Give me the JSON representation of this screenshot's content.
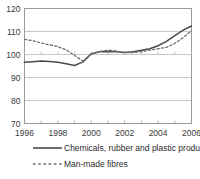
{
  "chart_data": {
    "type": "line",
    "title": "",
    "xlabel": "",
    "ylabel": "",
    "xlim": [
      1996,
      2006
    ],
    "ylim": [
      70,
      120
    ],
    "yticks": [
      70,
      80,
      90,
      100,
      110,
      120
    ],
    "xticks": [
      1996,
      1998,
      2000,
      2002,
      2004,
      2006
    ],
    "xtick_labels": [
      "1996",
      "1998",
      "2000",
      "2002",
      "2004",
      "2006"
    ],
    "ytick_labels": [
      "70",
      "80",
      "90",
      "100",
      "110",
      "120"
    ],
    "grid": true,
    "grid_axis": "y",
    "legend_position": "bottom",
    "x": [
      1996,
      1996.5,
      1997,
      1997.5,
      1998,
      1998.5,
      1999,
      1999.5,
      2000,
      2000.5,
      2001,
      2001.5,
      2002,
      2002.5,
      2003,
      2003.5,
      2004,
      2004.5,
      2005,
      2005.5,
      2006
    ],
    "series": [
      {
        "name": "Chemicals, rubber and plastic products",
        "style": "solid",
        "color": "#4a4a4a",
        "values": [
          96.6,
          96.9,
          97.2,
          97.0,
          96.6,
          96.0,
          95.2,
          96.8,
          100.3,
          101.2,
          101.3,
          101.2,
          100.9,
          101.2,
          101.8,
          102.5,
          103.8,
          105.7,
          108.2,
          110.6,
          112.4
        ]
      },
      {
        "name": "Man-made fibres",
        "style": "dashed",
        "color": "#6e6e6e",
        "values": [
          106.6,
          106.0,
          105.0,
          104.2,
          103.4,
          102.0,
          99.6,
          97.2,
          100.2,
          101.3,
          101.9,
          101.5,
          100.9,
          100.8,
          101.2,
          101.9,
          102.5,
          103.1,
          104.8,
          107.3,
          110.4
        ]
      }
    ]
  },
  "legend": {
    "items": [
      {
        "label": "Chemicals, rubber and plastic products",
        "style": "solid"
      },
      {
        "label": "Man-made fibres",
        "style": "dashed"
      }
    ]
  }
}
